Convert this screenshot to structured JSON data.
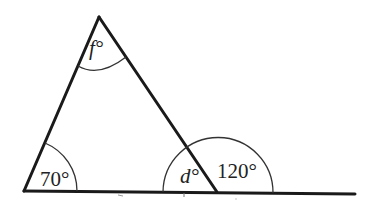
{
  "diagram": {
    "type": "geometry-triangle-exterior-angle",
    "vertices": {
      "apex": {
        "x": 99,
        "y": 17
      },
      "bottom_left": {
        "x": 24,
        "y": 191
      },
      "bottom_right": {
        "x": 217,
        "y": 192
      }
    },
    "base_line_end": {
      "x": 355,
      "y": 194
    },
    "angles": {
      "apex": {
        "label": "f°",
        "var": "f",
        "unit": "°"
      },
      "bottom_left": {
        "label": "70°",
        "value": "70",
        "unit": "°"
      },
      "interior_right": {
        "label": "d°",
        "var": "d",
        "unit": "°"
      },
      "exterior_right": {
        "label": "120°",
        "value": "120",
        "unit": "°"
      }
    },
    "colors": {
      "line": "#1a1a1a",
      "arc": "#333333",
      "text": "#222222",
      "background": "#ffffff"
    }
  }
}
